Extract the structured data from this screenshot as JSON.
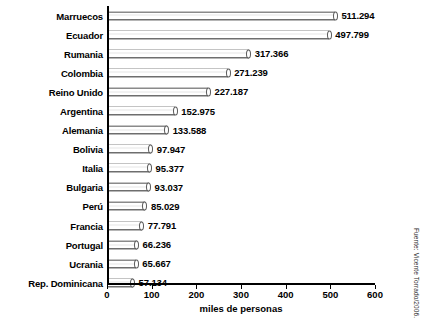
{
  "chart_data": {
    "type": "bar",
    "orientation": "horizontal",
    "title": "",
    "xlabel": "miles de personas",
    "ylabel": "",
    "xlim": [
      0,
      600
    ],
    "xticks": [
      0,
      100,
      200,
      300,
      400,
      500,
      600
    ],
    "grid": false,
    "legend": null,
    "categories": [
      "Marruecos",
      "Ecuador",
      "Rumania",
      "Colombia",
      "Reino Unido",
      "Argentina",
      "Alemania",
      "Bolivia",
      "Italia",
      "Bulgaria",
      "Perú",
      "Francia",
      "Portugal",
      "Ucrania",
      "Rep. Dominicana"
    ],
    "values": [
      511.294,
      497.799,
      317.366,
      271.239,
      227.187,
      152.975,
      133.588,
      97.947,
      95.377,
      93.037,
      85.029,
      77.791,
      66.236,
      65.667,
      57.134
    ],
    "value_labels": [
      "511.294",
      "497.799",
      "317.366",
      "271.239",
      "227.187",
      "152.975",
      "133.588",
      "97.947",
      "95.377",
      "93.037",
      "85.029",
      "77.791",
      "66.236",
      "65.667",
      "57.134"
    ],
    "annotations": [
      "Fuente: Vicente Torrado/2006."
    ]
  },
  "source": {
    "text": "Fuente: Vicente Torrado/2006."
  }
}
